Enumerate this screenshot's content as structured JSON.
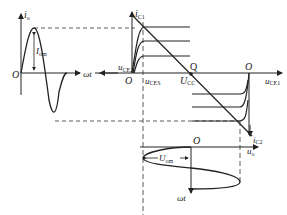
{
  "diagram": {
    "type": "complementary push-pull amplifier graphical analysis",
    "input_plot": {
      "y_axis_label": "i",
      "y_axis_sub": "o",
      "x_axis_label": "ωt",
      "origin": "O",
      "amplitude_label": "I",
      "amplitude_sub": "om"
    },
    "output_characteristics": {
      "y_axis_upper_label": "i",
      "y_axis_upper_sub": "C1",
      "x_axis_left_label": "u",
      "x_axis_left_sub": "CE2",
      "x_axis_right_label": "u",
      "x_axis_right_sub": "CE1",
      "saturation_label": "u",
      "saturation_sub": "CES",
      "supply_label": "U",
      "supply_sub": "CC",
      "q_point": "Q",
      "origin_left": "O",
      "origin_right": "O",
      "y_axis_lower_label": "i",
      "y_axis_lower_sub": "C2"
    },
    "output_voltage_plot": {
      "origin": "O",
      "x_axis_label": "u",
      "x_axis_sub": "o",
      "time_axis_label": "ωt",
      "amplitude_label": "U",
      "amplitude_sub": "om"
    }
  }
}
